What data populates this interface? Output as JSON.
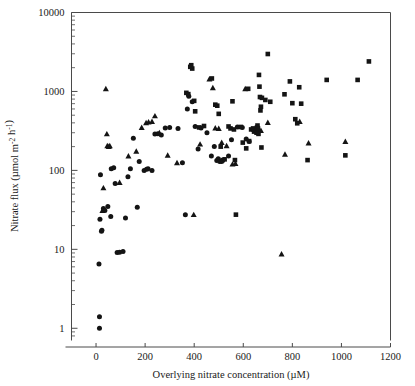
{
  "chart_data": {
    "type": "scatter",
    "title": "",
    "xlabel": "Overlying nitrate concentration (µM)",
    "ylabel": "Nitrate flux (µmol m⁻² h⁻¹)",
    "xscale": "linear",
    "yscale": "log",
    "xlim": [
      -100,
      1200
    ],
    "ylim": [
      0.7,
      10000
    ],
    "xticks": [
      0,
      200,
      400,
      600,
      800,
      1000,
      1200
    ],
    "xticklabels": [
      "0",
      "200",
      "400",
      "600",
      "800",
      "1000",
      "1200"
    ],
    "yticks": [
      1,
      10,
      100,
      1000,
      10000
    ],
    "yticklabels": [
      "1",
      "10",
      "100",
      "1000",
      "10000"
    ],
    "grid": false,
    "legend": "none",
    "marker_color": "#141414",
    "axis_color": "#4a4a4a",
    "series": [
      {
        "name": "circles",
        "marker": "circle",
        "points": [
          [
            12,
            6.5
          ],
          [
            14,
            1.4
          ],
          [
            14,
            1.0
          ],
          [
            16,
            24
          ],
          [
            18,
            88
          ],
          [
            22,
            17
          ],
          [
            24,
            17.5
          ],
          [
            30,
            33
          ],
          [
            36,
            31
          ],
          [
            48,
            35
          ],
          [
            60,
            26
          ],
          [
            62,
            105
          ],
          [
            72,
            108
          ],
          [
            78,
            68
          ],
          [
            86,
            9.1
          ],
          [
            96,
            9.2
          ],
          [
            110,
            9.4
          ],
          [
            120,
            25
          ],
          [
            130,
            83
          ],
          [
            140,
            105
          ],
          [
            152,
            255
          ],
          [
            168,
            34
          ],
          [
            176,
            130
          ],
          [
            196,
            100
          ],
          [
            206,
            103
          ],
          [
            212,
            105
          ],
          [
            228,
            100
          ],
          [
            240,
            290
          ],
          [
            252,
            292
          ],
          [
            266,
            280
          ],
          [
            282,
            345
          ],
          [
            300,
            350
          ],
          [
            334,
            340
          ],
          [
            352,
            125
          ],
          [
            364,
            27.5
          ],
          [
            372,
            600
          ],
          [
            378,
            870
          ],
          [
            392,
            740
          ],
          [
            404,
            360
          ],
          [
            416,
            186
          ],
          [
            428,
            345
          ],
          [
            452,
            300
          ],
          [
            470,
            152
          ],
          [
            482,
            200
          ],
          [
            492,
            133
          ],
          [
            498,
            140
          ],
          [
            504,
            130
          ],
          [
            512,
            130
          ],
          [
            540,
            152
          ],
          [
            552,
            245
          ],
          [
            576,
            355
          ],
          [
            596,
            350
          ],
          [
            612,
            250
          ],
          [
            624,
            232
          ]
        ]
      },
      {
        "name": "triangles",
        "marker": "triangle",
        "points": [
          [
            26,
            31
          ],
          [
            30,
            60
          ],
          [
            40,
            1080
          ],
          [
            44,
            290
          ],
          [
            46,
            205
          ],
          [
            52,
            200
          ],
          [
            56,
            205
          ],
          [
            96,
            70
          ],
          [
            132,
            152
          ],
          [
            164,
            175
          ],
          [
            186,
            350
          ],
          [
            204,
            400
          ],
          [
            214,
            410
          ],
          [
            228,
            415
          ],
          [
            240,
            490
          ],
          [
            258,
            300
          ],
          [
            292,
            155
          ],
          [
            330,
            125
          ],
          [
            398,
            27.5
          ],
          [
            424,
            215
          ],
          [
            462,
            1440
          ],
          [
            476,
            1110
          ],
          [
            486,
            345
          ],
          [
            500,
            340
          ],
          [
            512,
            225
          ],
          [
            532,
            205
          ],
          [
            556,
            120
          ],
          [
            568,
            122
          ],
          [
            608,
            1080
          ],
          [
            644,
            330
          ],
          [
            664,
            330
          ],
          [
            672,
            320
          ],
          [
            700,
            405
          ],
          [
            756,
            8.7
          ],
          [
            770,
            160
          ],
          [
            830,
            415
          ],
          [
            866,
            222
          ],
          [
            1016,
            232
          ]
        ]
      },
      {
        "name": "squares",
        "marker": "square",
        "points": [
          [
            368,
            960
          ],
          [
            376,
            925
          ],
          [
            384,
            2050
          ],
          [
            388,
            2150
          ],
          [
            392,
            1950
          ],
          [
            400,
            760
          ],
          [
            404,
            560
          ],
          [
            420,
            350
          ],
          [
            440,
            365
          ],
          [
            472,
            1460
          ],
          [
            486,
            680
          ],
          [
            494,
            660
          ],
          [
            500,
            520
          ],
          [
            508,
            200
          ],
          [
            516,
            135
          ],
          [
            524,
            138
          ],
          [
            540,
            360
          ],
          [
            548,
            340
          ],
          [
            556,
            750
          ],
          [
            562,
            330
          ],
          [
            566,
            135
          ],
          [
            570,
            27.5
          ],
          [
            590,
            355
          ],
          [
            598,
            225
          ],
          [
            612,
            190
          ],
          [
            620,
            1080
          ],
          [
            624,
            235
          ],
          [
            632,
            330
          ],
          [
            640,
            340
          ],
          [
            644,
            310
          ],
          [
            650,
            320
          ],
          [
            654,
            300
          ],
          [
            656,
            350
          ],
          [
            658,
            370
          ],
          [
            660,
            340
          ],
          [
            662,
            290
          ],
          [
            664,
            1620
          ],
          [
            666,
            1150
          ],
          [
            668,
            850
          ],
          [
            670,
            575
          ],
          [
            672,
            640
          ],
          [
            674,
            195
          ],
          [
            676,
            830
          ],
          [
            690,
            780
          ],
          [
            700,
            2980
          ],
          [
            710,
            740
          ],
          [
            768,
            920
          ],
          [
            790,
            1340
          ],
          [
            800,
            710
          ],
          [
            812,
            445
          ],
          [
            820,
            395
          ],
          [
            828,
            1130
          ],
          [
            836,
            700
          ],
          [
            862,
            135
          ],
          [
            940,
            1400
          ],
          [
            1016,
            155
          ],
          [
            1066,
            1400
          ],
          [
            1112,
            2400
          ]
        ]
      }
    ]
  }
}
